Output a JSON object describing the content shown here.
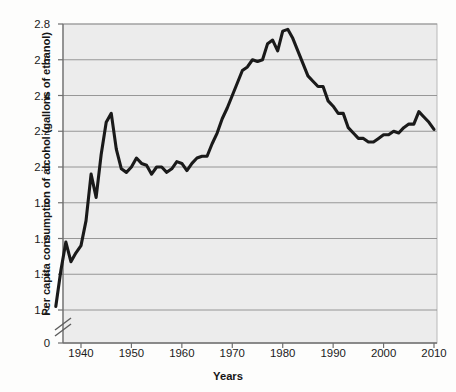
{
  "chart_data": {
    "type": "line",
    "title": "",
    "xlabel": "Years",
    "ylabel": "Per capita consumption of alcohol (gallons of ethanol)",
    "xlim": [
      1934,
      2011
    ],
    "ylim": [
      1.16,
      2.85
    ],
    "y_axis_break": true,
    "y_break_between": [
      0,
      1.2
    ],
    "grid": "horizontal",
    "legend": "none",
    "line_color": "#1a1a1a",
    "plot_background": "#eeeeee",
    "x_ticks": [
      1940,
      1950,
      1960,
      1970,
      1980,
      1990,
      2000,
      2010
    ],
    "x_tick_labels": [
      "1940",
      "1950",
      "1960",
      "1970",
      "1980",
      "1990",
      "2000",
      "2010"
    ],
    "y_ticks": [
      0,
      1.2,
      1.4,
      1.6,
      1.8,
      2.0,
      2.2,
      2.4,
      2.6,
      2.8
    ],
    "y_tick_labels": [
      "0",
      "1.2",
      "1.4",
      "1.6",
      "1.8",
      "2.0",
      "2.2",
      "2.4",
      "2.6",
      "2.8"
    ],
    "series": [
      {
        "name": "Per capita ethanol consumption",
        "x": [
          1935,
          1936,
          1937,
          1938,
          1939,
          1940,
          1941,
          1942,
          1943,
          1944,
          1945,
          1946,
          1947,
          1948,
          1949,
          1950,
          1951,
          1952,
          1953,
          1954,
          1955,
          1956,
          1957,
          1958,
          1959,
          1960,
          1961,
          1962,
          1963,
          1964,
          1965,
          1966,
          1967,
          1968,
          1969,
          1970,
          1971,
          1972,
          1973,
          1974,
          1975,
          1976,
          1977,
          1978,
          1979,
          1980,
          1981,
          1982,
          1983,
          1984,
          1985,
          1986,
          1987,
          1988,
          1989,
          1990,
          1991,
          1992,
          1993,
          1994,
          1995,
          1996,
          1997,
          1998,
          1999,
          2000,
          2001,
          2002,
          2003,
          2004,
          2005,
          2006,
          2007,
          2008,
          2009,
          2010
        ],
        "values": [
          1.22,
          1.42,
          1.58,
          1.47,
          1.52,
          1.56,
          1.7,
          1.96,
          1.83,
          2.07,
          2.25,
          2.3,
          2.1,
          1.99,
          1.97,
          2.0,
          2.05,
          2.02,
          2.01,
          1.96,
          2.0,
          2.0,
          1.97,
          1.99,
          2.03,
          2.02,
          1.98,
          2.02,
          2.05,
          2.06,
          2.06,
          2.13,
          2.19,
          2.27,
          2.33,
          2.4,
          2.47,
          2.54,
          2.56,
          2.6,
          2.59,
          2.6,
          2.69,
          2.71,
          2.65,
          2.76,
          2.77,
          2.72,
          2.65,
          2.58,
          2.51,
          2.48,
          2.45,
          2.45,
          2.37,
          2.34,
          2.3,
          2.3,
          2.22,
          2.19,
          2.16,
          2.16,
          2.14,
          2.14,
          2.16,
          2.18,
          2.18,
          2.2,
          2.19,
          2.22,
          2.24,
          2.24,
          2.31,
          2.28,
          2.25,
          2.21
        ]
      }
    ],
    "annotations": [
      {
        "label": "WWII spike peak",
        "x": 1946,
        "y": 2.3
      },
      {
        "label": "all-time peak",
        "x": 1981,
        "y": 2.77
      },
      {
        "label": "series start",
        "x": 1935,
        "y": 1.22
      },
      {
        "label": "series end",
        "x": 2010,
        "y": 2.21
      }
    ]
  },
  "axis": {
    "x_title": "Years",
    "y_title": "Per capita consumption of alcohol (gallons of ethanol)"
  }
}
